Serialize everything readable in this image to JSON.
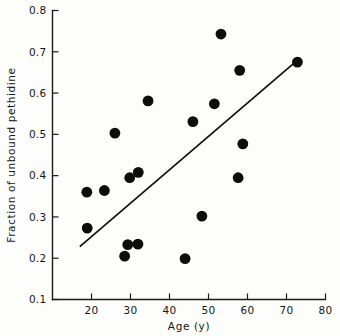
{
  "chart_data": {
    "type": "scatter",
    "title": "",
    "xlabel": "Age (y)",
    "ylabel": "Fraction of unbound pethidine",
    "xlim": [
      10,
      80
    ],
    "ylim": [
      0.1,
      0.8
    ],
    "xticks": [
      20,
      30,
      40,
      50,
      60,
      70,
      80
    ],
    "xtick_labels": [
      "20",
      "30",
      "40",
      "50",
      "60",
      "70",
      "80"
    ],
    "yticks": [
      0.1,
      0.2,
      0.3,
      0.4,
      0.5,
      0.6,
      0.7,
      0.8
    ],
    "ytick_labels": [
      "0.1",
      "0.2",
      "0.3",
      "0.4",
      "0.5",
      "0.6",
      "0.7",
      "0.8"
    ],
    "grid": false,
    "legend": false,
    "marker": "filled-circle",
    "marker_color": "#0d0d0d",
    "marker_size": 5.4,
    "points": [
      {
        "x": 18.8,
        "y": 0.36
      },
      {
        "x": 18.9,
        "y": 0.273
      },
      {
        "x": 23.3,
        "y": 0.364
      },
      {
        "x": 26.0,
        "y": 0.503
      },
      {
        "x": 28.5,
        "y": 0.205
      },
      {
        "x": 29.3,
        "y": 0.233
      },
      {
        "x": 29.8,
        "y": 0.395
      },
      {
        "x": 31.9,
        "y": 0.234
      },
      {
        "x": 32.0,
        "y": 0.408
      },
      {
        "x": 34.5,
        "y": 0.581
      },
      {
        "x": 44.0,
        "y": 0.199
      },
      {
        "x": 46.0,
        "y": 0.531
      },
      {
        "x": 48.3,
        "y": 0.302
      },
      {
        "x": 51.5,
        "y": 0.574
      },
      {
        "x": 53.2,
        "y": 0.743
      },
      {
        "x": 57.6,
        "y": 0.395
      },
      {
        "x": 58.0,
        "y": 0.655
      },
      {
        "x": 58.8,
        "y": 0.477
      },
      {
        "x": 72.8,
        "y": 0.675
      }
    ],
    "fit_line": {
      "name": "regression-line",
      "color": "#111111",
      "x_start": 17.0,
      "y_start": 0.228,
      "x_end": 73.5,
      "y_end": 0.685
    }
  }
}
